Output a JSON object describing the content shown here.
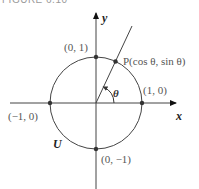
{
  "figure": {
    "caption": "FIGURE 6.10",
    "axes": {
      "x_label": "x",
      "y_label": "y"
    },
    "circle_label": "U",
    "angle_label": "θ",
    "point_labels": {
      "top": "(0, 1)",
      "right": "(1, 0)",
      "left": "(−1, 0)",
      "bottom": "(0, −1)",
      "P": "P(cos θ, sin θ)"
    },
    "colors": {
      "stroke": "#444444",
      "point": "#333333",
      "label": "#555555"
    }
  }
}
